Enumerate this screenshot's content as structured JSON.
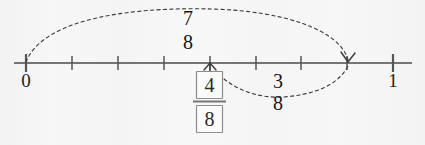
{
  "exercise": {
    "type": "number-line-fraction-addition",
    "background_color": "#f4f4f4",
    "ink_color": "#2b2b2b"
  },
  "number_line": {
    "start_label": "0",
    "end_label": "1",
    "start_value": 0,
    "end_value": 1,
    "denominator": 8,
    "tick_count": 9,
    "tick_values": [
      "0",
      "1/8",
      "2/8",
      "3/8",
      "4/8",
      "5/8",
      "6/8",
      "7/8",
      "1"
    ],
    "axis_y": 63,
    "axis_x_start": 14,
    "axis_x_end": 412,
    "zero_x": 26,
    "one_x": 393
  },
  "arcs": [
    {
      "name": "total-arc",
      "label_numerator": "7",
      "label_denominator": "8",
      "from_value": "0",
      "to_value": "7/8",
      "direction": "above",
      "style": "dashed",
      "has_arrowhead": true
    },
    {
      "name": "addend-arc",
      "label_numerator": "3",
      "label_denominator": "8",
      "from_value": "4/8",
      "to_value": "7/8",
      "direction": "below",
      "style": "dashed",
      "has_arrowhead": false
    }
  ],
  "answer": {
    "numerator": "4",
    "denominator": "8",
    "boxed": true,
    "marker": "caret-up",
    "marker_value": "4/8",
    "marker_x": 210
  }
}
